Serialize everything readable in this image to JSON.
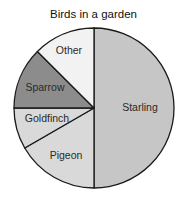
{
  "chart_data": {
    "type": "pie",
    "title": "Birds in a garden",
    "start_angle_deg": 0,
    "direction": "clockwise",
    "slices": [
      {
        "label": "Starling",
        "angle_deg": 180,
        "percent": 50.0,
        "color": "#c6c6c6"
      },
      {
        "label": "Pigeon",
        "angle_deg": 60,
        "percent": 16.7,
        "color": "#d9d9d9"
      },
      {
        "label": "Goldfinch",
        "angle_deg": 30,
        "percent": 8.3,
        "color": "#d9d9d9"
      },
      {
        "label": "Sparrow",
        "angle_deg": 45,
        "percent": 12.5,
        "color": "#8c8c8c"
      },
      {
        "label": "Other",
        "angle_deg": 45,
        "percent": 12.5,
        "color": "#f2f2f2"
      }
    ],
    "categories": [
      "Starling",
      "Pigeon",
      "Goldfinch",
      "Sparrow",
      "Other"
    ],
    "values": [
      180,
      60,
      30,
      45,
      45
    ],
    "legend": "none (labels inside slices)",
    "outline_color": "#1a1a1a"
  }
}
